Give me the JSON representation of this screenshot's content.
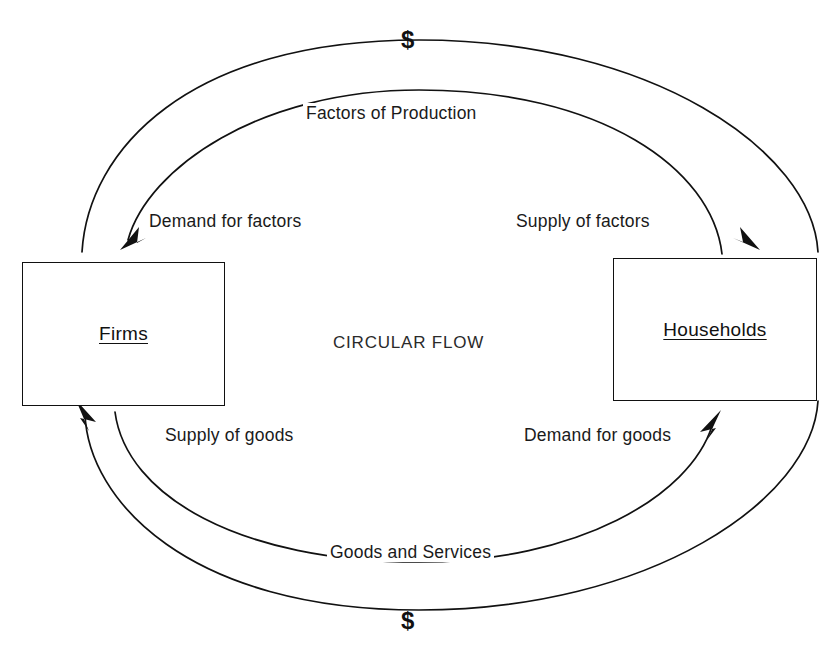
{
  "diagram": {
    "title": "CIRCULAR FLOW",
    "nodes": [
      {
        "id": "firms",
        "label": "Firms"
      },
      {
        "id": "households",
        "label": "Households"
      }
    ],
    "flows": [
      {
        "id": "money-for-factors",
        "label": "$",
        "from": "households",
        "to": "firms",
        "path": "outer-top",
        "direction": "clockwise-left"
      },
      {
        "id": "factors-of-production",
        "label": "Factors of Production",
        "from": "households",
        "to": "firms",
        "path": "inner-top",
        "direction": "right-to-left"
      },
      {
        "id": "demand-for-factors",
        "label": "Demand for factors",
        "endpoint": "firms",
        "path": "inner-top-left"
      },
      {
        "id": "supply-of-factors",
        "label": "Supply of factors",
        "endpoint": "households",
        "path": "outer-top-right"
      },
      {
        "id": "supply-of-goods",
        "label": "Supply of goods",
        "endpoint": "firms",
        "path": "outer-bottom-left"
      },
      {
        "id": "demand-for-goods",
        "label": "Demand for goods",
        "endpoint": "households",
        "path": "inner-bottom-right"
      },
      {
        "id": "goods-and-services",
        "label": "Goods and Services",
        "from": "firms",
        "to": "households",
        "path": "inner-bottom",
        "direction": "left-to-right"
      },
      {
        "id": "money-for-goods",
        "label": "$",
        "from": "households",
        "to": "firms",
        "path": "outer-bottom",
        "direction": "right-to-left"
      }
    ],
    "money_symbols": {
      "top": "$",
      "bottom": "$"
    },
    "colors": {
      "background": "#ffffff",
      "stroke": "#111111",
      "text": "#1a1a1a"
    }
  }
}
